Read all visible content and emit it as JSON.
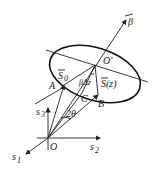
{
  "diagram": {
    "labels": {
      "beta_vec": "β",
      "O_prime": "O'",
      "S0": "S",
      "S0_sub": "0",
      "Sz": "S(z)",
      "beta_dz": "βΔz",
      "A": "A",
      "B": "B",
      "C": "C",
      "two_theta": "2θ",
      "O": "O",
      "s1": "s",
      "s1_sub": "1",
      "s2": "s",
      "s2_sub": "2",
      "s3": "s",
      "s3_sub": "3"
    }
  }
}
